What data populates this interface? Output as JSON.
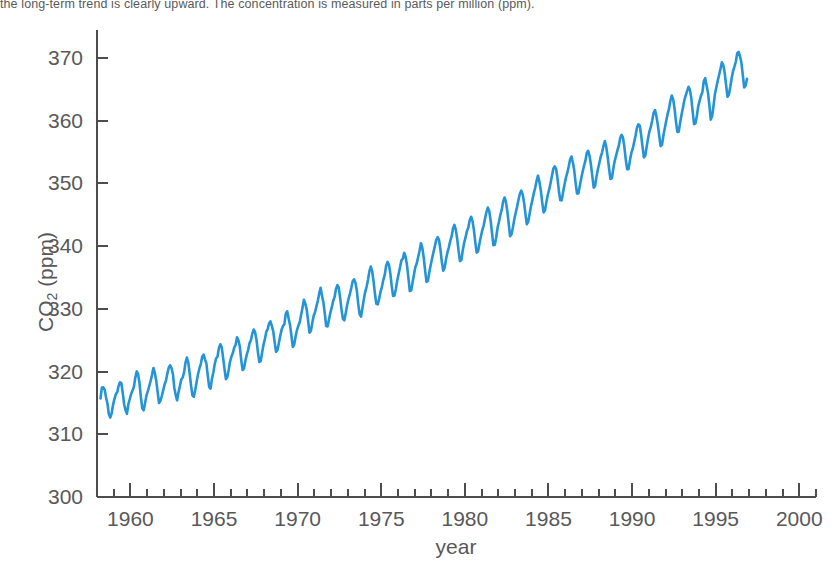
{
  "caption": {
    "text": "the long-term trend is clearly upward. The concentration is measured in parts per million (ppm)."
  },
  "axis_label_x": "year",
  "axis_label_y_main": "CO",
  "axis_label_y_sub": "2",
  "axis_label_y_tail": " (ppm)",
  "colors": {
    "line": "#2494d6",
    "axis": "#4d4d4d",
    "text": "#58585a",
    "background": "#ffffff"
  },
  "chart_data": {
    "type": "line",
    "title": "",
    "subtitle": "",
    "xlabel": "year",
    "ylabel": "CO2 (ppm)",
    "xlim": [
      1958.0,
      2001.0
    ],
    "ylim": [
      300,
      374
    ],
    "grid": false,
    "legend": null,
    "x_ticks": [
      1960,
      1965,
      1970,
      1975,
      1980,
      1985,
      1990,
      1995,
      2000
    ],
    "x_minor_tick_interval": 1,
    "y_ticks": [
      300,
      310,
      320,
      330,
      340,
      350,
      360,
      370
    ],
    "series": [
      {
        "name": "Atmospheric CO2 (Mauna Loa)",
        "units": "ppm",
        "sampling": "monthly",
        "x_start": 1958.208,
        "x_step": 0.08333,
        "values": [
          315.71,
          317.45,
          317.5,
          317.1,
          315.86,
          314.93,
          313.2,
          312.66,
          313.33,
          314.67,
          315.62,
          316.38,
          316.71,
          317.72,
          318.29,
          318.15,
          316.54,
          314.8,
          313.84,
          313.26,
          314.8,
          315.59,
          316.43,
          316.97,
          317.58,
          319.02,
          320.03,
          319.59,
          318.18,
          315.91,
          314.16,
          313.83,
          315.0,
          316.19,
          316.89,
          317.7,
          318.54,
          319.48,
          320.58,
          319.78,
          318.58,
          316.79,
          314.99,
          315.31,
          316.1,
          317.01,
          317.94,
          318.56,
          319.68,
          320.63,
          321.01,
          320.55,
          319.58,
          317.4,
          316.26,
          315.42,
          316.69,
          317.69,
          318.74,
          319.08,
          319.86,
          321.39,
          322.24,
          321.47,
          319.74,
          317.77,
          316.21,
          315.99,
          317.07,
          318.36,
          319.57,
          320.5,
          321.2,
          322.37,
          322.71,
          321.96,
          321.3,
          319.39,
          317.56,
          317.29,
          318.87,
          319.87,
          321.21,
          322.1,
          322.4,
          323.74,
          324.35,
          323.89,
          322.23,
          320.45,
          318.8,
          319.09,
          320.26,
          321.6,
          322.41,
          322.95,
          323.83,
          324.27,
          325.47,
          325.0,
          323.99,
          321.87,
          320.25,
          320.49,
          321.74,
          322.71,
          323.47,
          324.54,
          325.03,
          326.09,
          326.71,
          326.25,
          325.02,
          323.07,
          321.53,
          321.68,
          323.04,
          324.27,
          325.19,
          326.33,
          326.8,
          327.68,
          328.02,
          327.25,
          326.42,
          324.69,
          323.15,
          323.41,
          324.53,
          325.68,
          326.69,
          327.27,
          327.57,
          329.24,
          329.62,
          328.52,
          327.48,
          325.81,
          323.93,
          324.26,
          325.57,
          326.6,
          327.3,
          327.87,
          329.07,
          330.19,
          331.45,
          330.84,
          329.93,
          328.15,
          326.21,
          326.48,
          327.75,
          328.9,
          329.48,
          330.43,
          331.32,
          332.47,
          333.36,
          332.08,
          331.01,
          329.23,
          327.27,
          327.21,
          328.29,
          329.41,
          330.23,
          331.25,
          331.87,
          333.14,
          333.8,
          333.43,
          331.73,
          329.9,
          328.4,
          328.17,
          329.32,
          330.59,
          331.58,
          332.39,
          333.33,
          334.41,
          334.71,
          334.17,
          332.89,
          330.77,
          329.14,
          328.78,
          330.14,
          331.52,
          332.75,
          333.52,
          334.64,
          336.02,
          336.75,
          336.0,
          334.37,
          332.37,
          330.81,
          330.72,
          331.59,
          332.75,
          333.52,
          334.64,
          335.41,
          336.84,
          337.5,
          337.07,
          335.7,
          333.71,
          332.06,
          332.14,
          333.18,
          334.55,
          335.6,
          336.64,
          337.76,
          338.02,
          338.93,
          338.3,
          336.95,
          334.96,
          332.85,
          332.94,
          334.24,
          335.48,
          336.67,
          337.28,
          338.28,
          339.28,
          340.48,
          339.72,
          338.13,
          336.12,
          334.3,
          334.48,
          335.83,
          336.99,
          338.04,
          339.05,
          340.01,
          341.01,
          341.44,
          340.96,
          339.44,
          337.48,
          336.08,
          336.57,
          337.91,
          339.0,
          339.81,
          340.81,
          341.56,
          342.83,
          343.39,
          342.63,
          341.21,
          339.25,
          337.63,
          337.77,
          339.31,
          340.5,
          341.4,
          342.4,
          342.99,
          344.14,
          344.7,
          344.0,
          342.6,
          340.64,
          338.97,
          339.19,
          340.41,
          341.55,
          342.52,
          343.29,
          344.43,
          345.45,
          346.16,
          345.61,
          344.12,
          342.11,
          340.15,
          340.22,
          341.39,
          342.96,
          343.89,
          345.01,
          345.82,
          347.15,
          347.77,
          347.05,
          345.59,
          343.55,
          341.58,
          341.9,
          343.02,
          344.31,
          345.34,
          346.28,
          347.4,
          348.37,
          348.87,
          348.27,
          346.96,
          345.14,
          343.5,
          343.92,
          345.17,
          346.41,
          347.39,
          348.43,
          349.32,
          350.42,
          351.25,
          350.3,
          348.93,
          347.06,
          345.39,
          345.68,
          346.99,
          348.16,
          349.02,
          350.05,
          351.2,
          352.35,
          352.74,
          352.28,
          350.82,
          348.81,
          347.32,
          347.31,
          348.59,
          349.81,
          350.89,
          351.68,
          352.66,
          353.78,
          354.3,
          353.39,
          352.1,
          350.09,
          348.4,
          348.41,
          349.59,
          350.81,
          351.82,
          352.79,
          353.6,
          354.86,
          355.22,
          354.38,
          352.99,
          351.15,
          349.34,
          349.61,
          351.13,
          352.28,
          353.23,
          354.25,
          354.98,
          356.02,
          356.78,
          355.84,
          354.27,
          352.39,
          350.71,
          350.84,
          352.29,
          353.53,
          354.39,
          355.29,
          356.03,
          357.24,
          357.76,
          357.31,
          355.81,
          353.82,
          352.28,
          352.29,
          353.7,
          354.88,
          355.55,
          356.58,
          357.62,
          358.88,
          359.43,
          359.26,
          357.78,
          355.91,
          354.15,
          354.42,
          355.87,
          357.21,
          358.32,
          359.02,
          360.08,
          361.31,
          361.71,
          360.73,
          359.35,
          357.65,
          355.96,
          356.16,
          357.65,
          358.82,
          359.97,
          361.05,
          361.9,
          363.17,
          364.03,
          363.45,
          361.95,
          359.96,
          358.22,
          358.27,
          359.68,
          360.96,
          362.05,
          363.25,
          364.03,
          364.72,
          365.41,
          364.97,
          363.65,
          361.49,
          359.46,
          359.6,
          360.76,
          362.33,
          363.18,
          364.0,
          364.57,
          366.35,
          366.79,
          365.62,
          364.47,
          362.51,
          360.19,
          360.77,
          362.43,
          364.28,
          365.35,
          366.38,
          367.34,
          368.3,
          369.32,
          368.86,
          367.62,
          365.72,
          363.82,
          364.18,
          365.38,
          366.83,
          367.92,
          368.63,
          369.46,
          370.77,
          370.99,
          370.28,
          369.24,
          367.28,
          365.31,
          365.61,
          366.69
        ]
      }
    ]
  }
}
